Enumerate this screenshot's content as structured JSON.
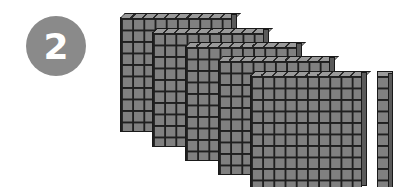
{
  "badge": {
    "label": "2",
    "color": "#8a8a8a"
  },
  "figure": {
    "flats": [
      {
        "name": "flat-1",
        "left": 120,
        "top": 17
      },
      {
        "name": "flat-2",
        "left": 152,
        "top": 32
      },
      {
        "name": "flat-3",
        "left": 185,
        "top": 46
      },
      {
        "name": "flat-4",
        "left": 218,
        "top": 60
      },
      {
        "name": "flat-5",
        "left": 250,
        "top": 75
      }
    ],
    "rod": {
      "name": "ten-rod",
      "count": 1
    },
    "flat_count": 5,
    "block_color": "#808080",
    "grid_line_color": "#1f1f1f"
  }
}
